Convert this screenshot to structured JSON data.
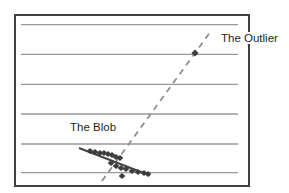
{
  "colors": {
    "background": "#ffffff",
    "frame": "#404040",
    "gridline": "#999999",
    "dashed_line": "#8f8f8f",
    "blob_line": "#474747",
    "point": "#3d3d3d",
    "label_text": "#1f1f1f"
  },
  "chart_data": {
    "type": "scatter",
    "title": "",
    "xlabel": "",
    "ylabel": "",
    "grid": "horizontal-only",
    "annotations": [
      {
        "label": "The Blob",
        "x": 69,
        "y": 121
      },
      {
        "label": "The Outlier",
        "x": 220,
        "y": 32
      }
    ],
    "frame": {
      "x": 15,
      "y": 15,
      "width": 234,
      "height": 171
    },
    "gridlines_y": [
      24.7,
      54.3,
      84.3,
      114,
      144,
      172.7
    ],
    "gridline_x_range": [
      21,
      238
    ],
    "dashed_trend_line": {
      "x1": 102,
      "y1": 181,
      "x2": 211,
      "y2": 31
    },
    "blob_trend_line": {
      "x1": 79,
      "y1": 148,
      "x2": 150,
      "y2": 175.5
    },
    "blob_points": [
      [
        90,
        151
      ],
      [
        95,
        152
      ],
      [
        100,
        153
      ],
      [
        104,
        153
      ],
      [
        108,
        154
      ],
      [
        112,
        155
      ],
      [
        116,
        157
      ],
      [
        120,
        158
      ],
      [
        111,
        163
      ],
      [
        116,
        166
      ],
      [
        121,
        168
      ],
      [
        126,
        169
      ],
      [
        132,
        171
      ],
      [
        138,
        172
      ],
      [
        144,
        173
      ],
      [
        148,
        174
      ],
      [
        122,
        176
      ]
    ],
    "outlier_point": [
      195,
      53
    ]
  }
}
